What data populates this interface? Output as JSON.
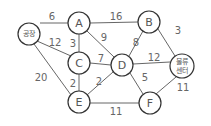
{
  "diagram": {
    "type": "weighted-graph",
    "nodes": [
      {
        "id": "factory",
        "label": "공장",
        "x": 29,
        "y": 34,
        "r": 11
      },
      {
        "id": "A",
        "label": "A",
        "x": 79,
        "y": 23,
        "r": 11
      },
      {
        "id": "B",
        "label": "B",
        "x": 149,
        "y": 22,
        "r": 11
      },
      {
        "id": "C",
        "label": "C",
        "x": 79,
        "y": 63,
        "r": 11
      },
      {
        "id": "D",
        "label": "D",
        "x": 122,
        "y": 65,
        "r": 11
      },
      {
        "id": "E",
        "label": "E",
        "x": 79,
        "y": 102,
        "r": 11
      },
      {
        "id": "F",
        "label": "F",
        "x": 150,
        "y": 103,
        "r": 11
      },
      {
        "id": "center",
        "label_line1": "물류",
        "label_line2": "센터",
        "x": 182,
        "y": 66,
        "r": 12
      }
    ],
    "edges": [
      {
        "from": "factory",
        "to": "A",
        "weight": "6",
        "lx": 52,
        "ly": 17
      },
      {
        "from": "factory",
        "to": "C",
        "weight": "12",
        "lx": 56,
        "ly": 41
      },
      {
        "from": "factory",
        "to": "E",
        "weight": "20",
        "lx": 40,
        "ly": 77
      },
      {
        "from": "A",
        "to": "B",
        "weight": "16",
        "lx": 116,
        "ly": 16
      },
      {
        "from": "A",
        "to": "C",
        "weight": "3",
        "lx": 73,
        "ly": 43
      },
      {
        "from": "A",
        "to": "D",
        "weight": "9",
        "lx": 104,
        "ly": 37
      },
      {
        "from": "B",
        "to": "D",
        "weight": "8",
        "lx": 136,
        "ly": 42
      },
      {
        "from": "B",
        "to": "center",
        "weight": "3",
        "lx": 178,
        "ly": 30
      },
      {
        "from": "C",
        "to": "D",
        "weight": "7",
        "lx": 101,
        "ly": 58
      },
      {
        "from": "C",
        "to": "E",
        "weight": "2",
        "lx": 73,
        "ly": 83
      },
      {
        "from": "D",
        "to": "E",
        "weight": "2",
        "lx": 99,
        "ly": 82
      },
      {
        "from": "D",
        "to": "center",
        "weight": "12",
        "lx": 153,
        "ly": 56
      },
      {
        "from": "D",
        "to": "F",
        "weight": "5",
        "lx": 145,
        "ly": 77
      },
      {
        "from": "E",
        "to": "F",
        "weight": "11",
        "lx": 116,
        "ly": 111
      },
      {
        "from": "F",
        "to": "center",
        "weight": "11",
        "lx": 183,
        "ly": 87
      }
    ]
  }
}
